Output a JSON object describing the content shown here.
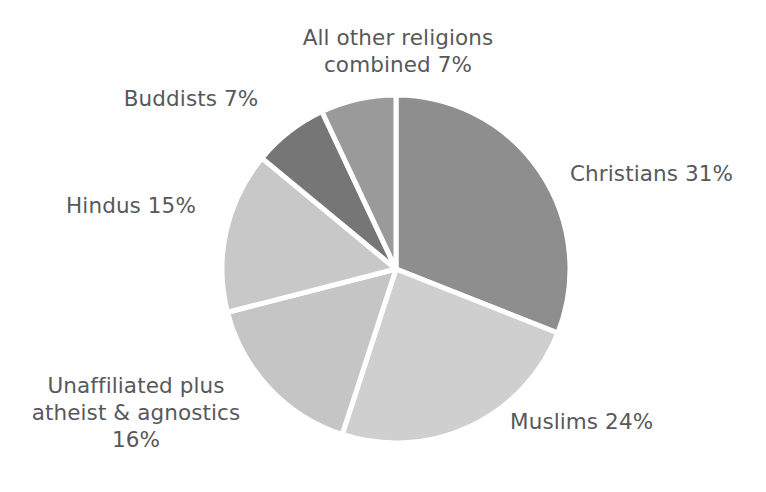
{
  "figure": {
    "background": "#ffffff",
    "width": 766,
    "height": 492,
    "cropped_title_fragment": ""
  },
  "chart_data": {
    "type": "pie",
    "title": "",
    "xlabel": "",
    "ylabel": "",
    "grid": false,
    "legend": "none",
    "labels_position": "outside-callout-text",
    "units": "percent",
    "total": 100,
    "start_angle_deg": 0,
    "direction": "clockwise",
    "categories": [
      "Christians",
      "Muslims",
      "Unaffiliated plus atheist & agnostics",
      "Hindus",
      "Buddists",
      "All other religions combined"
    ],
    "values": [
      31,
      24,
      16,
      15,
      7,
      7
    ],
    "slices": [
      {
        "name": "Christians",
        "label": "Christians 31%",
        "value": 31,
        "value_text": "31%",
        "color": "#8e8e8e",
        "start_deg": 0,
        "end_deg": 111.6
      },
      {
        "name": "Muslims",
        "label": "Muslims 24%",
        "value": 24,
        "value_text": "24%",
        "color": "#cfcfcf",
        "start_deg": 111.6,
        "end_deg": 198.0
      },
      {
        "name": "Unaffiliated plus atheist & agnostics",
        "label": "Unaffiliated plus\natheist & agnostics\n16%",
        "value": 16,
        "value_text": "16%",
        "color": "#c5c5c5",
        "start_deg": 198.0,
        "end_deg": 255.6
      },
      {
        "name": "Hindus",
        "label": "Hindus 15%",
        "value": 15,
        "value_text": "15%",
        "color": "#c8c8c8",
        "start_deg": 255.6,
        "end_deg": 309.6
      },
      {
        "name": "Buddists",
        "label": "Buddists 7%",
        "value": 7,
        "value_text": "7%",
        "color": "#767676",
        "start_deg": 309.6,
        "end_deg": 334.8
      },
      {
        "name": "All other religions combined",
        "label": "All other religions\ncombined 7%",
        "value": 7,
        "value_text": "7%",
        "color": "#9a9a9a",
        "start_deg": 334.8,
        "end_deg": 360.0
      }
    ],
    "separator_color": "#ffffff",
    "label_color": "#58585a"
  },
  "labels": {
    "other_religions": "All other religions\ncombined 7%",
    "buddists": "Buddists 7%",
    "hindus": "Hindus 15%",
    "unaffiliated": "Unaffiliated plus\natheist & agnostics\n16%",
    "christians": "Christians 31%",
    "muslims": "Muslims 24%"
  }
}
